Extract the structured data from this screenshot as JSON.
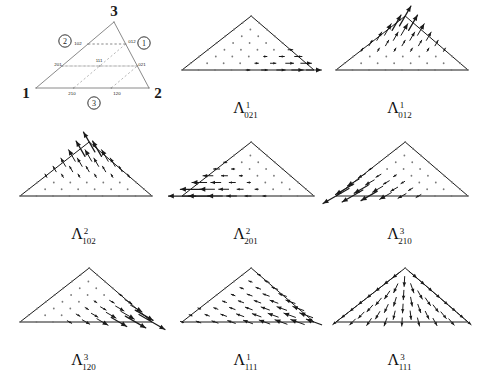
{
  "figure": {
    "type": "vector-field-diagram",
    "width": 484,
    "height": 377,
    "background": "#ffffff",
    "ink_color": "#1a1a1a",
    "grid_dot_color": "#7a7a7a",
    "dashed_color": "#9a9a9a"
  },
  "reference_triangle": {
    "name": "barycentric-reference-triangle",
    "vertex_labels": [
      "1",
      "3",
      "2"
    ],
    "vertex_1": "1",
    "vertex_2": "2",
    "vertex_3": "3",
    "edge_markers": [
      "1",
      "2",
      "3"
    ],
    "edge_marker_1": "1",
    "edge_marker_2": "2",
    "edge_marker_3": "3",
    "interior_labels": [
      "102",
      "012",
      "201",
      "111",
      "021",
      "210",
      "120"
    ],
    "label_102": "102",
    "label_012": "012",
    "label_201": "201",
    "label_111": "111",
    "label_021": "021",
    "label_210": "210",
    "label_120": "120"
  },
  "panels": [
    {
      "id": "p021",
      "caption_base": "Λ",
      "caption_sup": "1",
      "caption_sub": "021",
      "field": "horizontal-right",
      "lattice_order": 8,
      "direction_deg": 0,
      "weight_mode": "right-edge",
      "scale": 1.0
    },
    {
      "id": "p012",
      "caption_base": "Λ",
      "caption_sup": "1",
      "caption_sub": "012",
      "field": "diagonal-up-right",
      "lattice_order": 8,
      "direction_deg": 60,
      "weight_mode": "apex",
      "scale": 1.0
    },
    {
      "id": "p102",
      "caption_base": "Λ",
      "caption_sup": "2",
      "caption_sub": "102",
      "field": "diagonal-up-left",
      "lattice_order": 8,
      "direction_deg": 120,
      "weight_mode": "apex",
      "scale": 1.0
    },
    {
      "id": "p201",
      "caption_base": "Λ",
      "caption_sup": "2",
      "caption_sub": "201",
      "field": "horizontal-left",
      "lattice_order": 8,
      "direction_deg": 180,
      "weight_mode": "left-vertex",
      "scale": 1.0
    },
    {
      "id": "p210",
      "caption_base": "Λ",
      "caption_sup": "3",
      "caption_sub": "210",
      "field": "diagonal-down-left",
      "lattice_order": 8,
      "direction_deg": 210,
      "weight_mode": "bottom-left",
      "scale": 1.0
    },
    {
      "id": "p120",
      "caption_base": "Λ",
      "caption_sup": "3",
      "caption_sub": "120",
      "field": "diagonal-down-right",
      "lattice_order": 8,
      "direction_deg": -30,
      "weight_mode": "bottom-right",
      "scale": 1.0
    },
    {
      "id": "p111a",
      "caption_base": "Λ",
      "caption_sup": "1",
      "caption_sub": "111",
      "field": "interior-up-left",
      "lattice_order": 8,
      "direction_deg": 160,
      "weight_mode": "interior",
      "scale": 1.0
    },
    {
      "id": "p111b",
      "caption_base": "Λ",
      "caption_sup": "3",
      "caption_sub": "111",
      "field": "radial-fan-down",
      "lattice_order": 8,
      "direction_deg": 270,
      "weight_mode": "radial",
      "scale": 1.0
    }
  ],
  "layout": {
    "columns": 3,
    "rows": 3,
    "panel_width": 160,
    "panel_height": 125
  }
}
